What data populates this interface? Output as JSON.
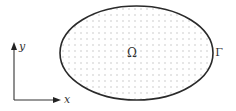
{
  "diagram": {
    "domain_label": "Ω",
    "boundary_label": "Γ",
    "axes": {
      "x_label": "x",
      "y_label": "y"
    },
    "colors": {
      "outline": "#2a2a2a",
      "dots": "#b8b8b8",
      "text": "#333333"
    }
  }
}
